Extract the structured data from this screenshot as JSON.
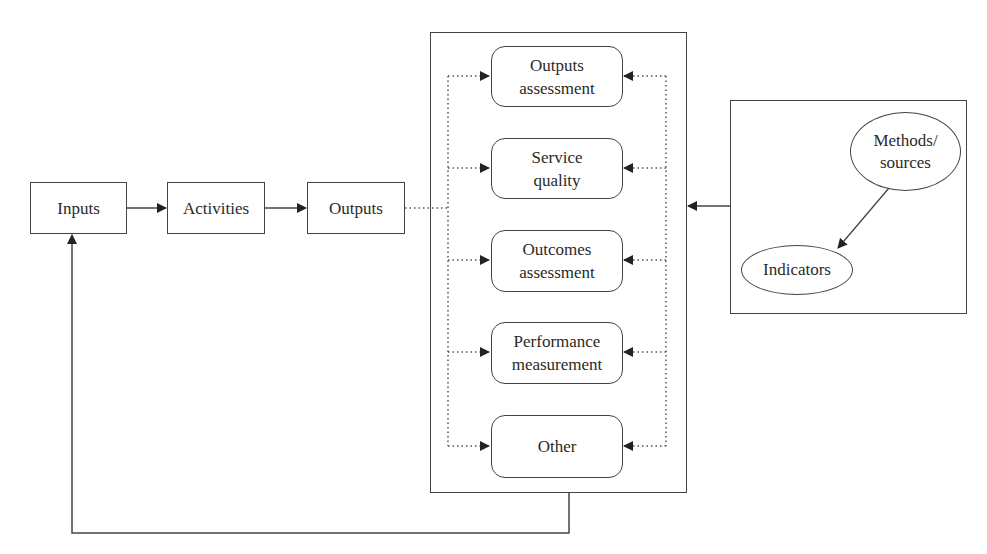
{
  "diagram": {
    "process_chain": [
      {
        "id": "inputs",
        "label": "Inputs"
      },
      {
        "id": "activities",
        "label": "Activities"
      },
      {
        "id": "outputs",
        "label": "Outputs"
      }
    ],
    "evaluation_types": [
      {
        "id": "outputs-assessment",
        "label": "Outputs\nassessment"
      },
      {
        "id": "service-quality",
        "label": "Service\nquality"
      },
      {
        "id": "outcomes-assessment",
        "label": "Outcomes\nassessment"
      },
      {
        "id": "performance-measurement",
        "label": "Performance\nmeasurement"
      },
      {
        "id": "other",
        "label": "Other"
      }
    ],
    "measurement": {
      "methods_sources": "Methods/\nsources",
      "indicators": "Indicators"
    },
    "edges": [
      {
        "from": "inputs",
        "to": "activities",
        "style": "solid-arrow"
      },
      {
        "from": "activities",
        "to": "outputs",
        "style": "solid-arrow"
      },
      {
        "from": "outputs",
        "to": "evaluation_types",
        "style": "dotted-fanout-arrows"
      },
      {
        "from": "measurement",
        "to": "evaluation_types",
        "style": "solid-arrow + dotted-fanout-arrows"
      },
      {
        "from": "methods_sources",
        "to": "indicators",
        "style": "solid-arrow"
      },
      {
        "from": "evaluation_types",
        "to": "inputs",
        "style": "solid-feedback-arrow"
      }
    ],
    "colors": {
      "stroke": "#444444",
      "text": "#2a2a2a",
      "background": "#ffffff"
    }
  }
}
